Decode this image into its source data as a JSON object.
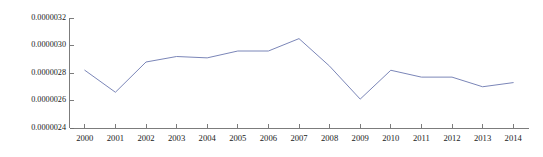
{
  "chart_data": {
    "type": "line",
    "title": "",
    "subtitle": "",
    "xlabel": "",
    "ylabel": "",
    "grid": false,
    "legend": "none",
    "x": [
      "2000",
      "2001",
      "2002",
      "2003",
      "2004",
      "2005",
      "2006",
      "2007",
      "2008",
      "2009",
      "2010",
      "2011",
      "2012",
      "2013",
      "2014"
    ],
    "categories": [
      "2000",
      "2001",
      "2002",
      "2003",
      "2004",
      "2005",
      "2006",
      "2007",
      "2008",
      "2009",
      "2010",
      "2011",
      "2012",
      "2013",
      "2014"
    ],
    "series": [
      {
        "name": "",
        "color": "#7b86b8",
        "values": [
          2.82e-06,
          2.66e-06,
          2.88e-06,
          2.92e-06,
          2.91e-06,
          2.96e-06,
          2.96e-06,
          3.05e-06,
          2.85e-06,
          2.61e-06,
          2.82e-06,
          2.77e-06,
          2.77e-06,
          2.7e-06,
          2.73e-06
        ]
      }
    ],
    "ylim": [
      2.4e-06,
      3.2e-06
    ],
    "yticks": [
      2.4e-06,
      2.6e-06,
      2.8e-06,
      3e-06,
      3.2e-06
    ],
    "ytick_labels": [
      "0.0000024",
      "0.0000026",
      "0.0000028",
      "0.0000030",
      "0.0000032"
    ],
    "xtick_labels": [
      "2000",
      "2001",
      "2002",
      "2003",
      "2004",
      "2005",
      "2006",
      "2007",
      "2008",
      "2009",
      "2010",
      "2011",
      "2012",
      "2013",
      "2014"
    ],
    "annotations": []
  },
  "style": {
    "background_color": "#ffffff",
    "axis_color": "#6e6e6e",
    "text_color": "#1a1a1a",
    "line_color": "#7b86b8"
  }
}
